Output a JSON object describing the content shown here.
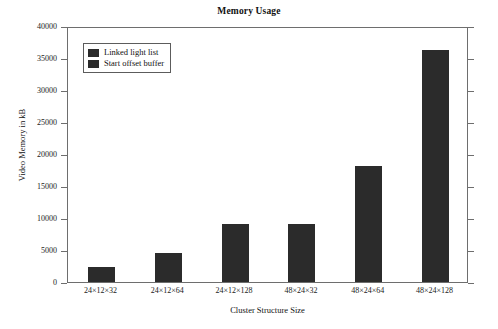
{
  "chart_data": {
    "type": "bar",
    "title": "Memory Usage",
    "xlabel": "Cluster Structure Size",
    "ylabel": "Video Memory in kB",
    "categories": [
      "24×12×32",
      "24×12×64",
      "24×12×128",
      "48×24×32",
      "48×24×64",
      "48×24×128"
    ],
    "values": [
      2300,
      4600,
      9000,
      9100,
      18200,
      36200
    ],
    "series": [
      {
        "name": "Start offset buffer",
        "values": [
          2300,
          4600,
          9000,
          9100,
          18200,
          36200
        ]
      }
    ],
    "ylim": [
      0,
      40000
    ],
    "yticks": [
      0,
      5000,
      10000,
      15000,
      20000,
      25000,
      30000,
      35000,
      40000
    ],
    "ytick_labels": [
      "0",
      "5000",
      "10000",
      "15000",
      "20000",
      "25000",
      "30000",
      "35000",
      "40000"
    ],
    "grid": false,
    "legend_position": "upper left",
    "legend_entries": [
      "Linked light list",
      "Start offset buffer"
    ],
    "bar_color": "#2b2b2b",
    "axis_color": "#6e6e6e",
    "background_color": "#ffffff"
  }
}
